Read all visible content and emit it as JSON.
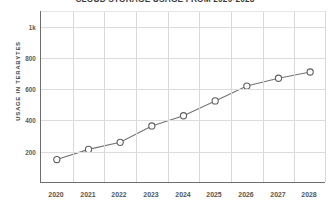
{
  "chart_data": {
    "type": "line",
    "title": "CLOUD STORAGE USAGE FROM 2020-2028",
    "xlabel": "",
    "ylabel": "USAGE IN TERABYTES",
    "categories": [
      "2020",
      "2021",
      "2022",
      "2023",
      "2024",
      "2025",
      "2026",
      "2027",
      "2028"
    ],
    "values": [
      150,
      215,
      260,
      365,
      430,
      525,
      620,
      670,
      710
    ],
    "series": [
      {
        "name": "Usage in terabytes",
        "values": [
          150,
          215,
          260,
          365,
          430,
          525,
          620,
          670,
          710
        ]
      }
    ],
    "ylim": [
      0,
      1100
    ],
    "yticks": [
      200,
      400,
      600,
      800,
      1000
    ],
    "ytick_labels": [
      "200",
      "400",
      "600",
      "800",
      "1k"
    ],
    "grid": true,
    "legend": "none",
    "marker": "open-circle",
    "line_color": "#737373",
    "marker_fill": "#ffffff",
    "marker_edge_color": "#5f5f5f",
    "grid_color": "#dcdcdc",
    "axis_color": "#6e6e6e",
    "text_color": "#555555",
    "background": "#ffffff"
  }
}
